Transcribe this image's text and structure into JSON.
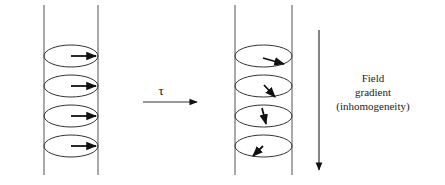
{
  "diagram": {
    "colors": {
      "line": "#444444",
      "arrow": "#111111",
      "background": "#ffffff"
    },
    "left_tube": {
      "x_left": 44,
      "x_right": 98,
      "y_top": 5,
      "y_bottom": 175,
      "spins": [
        {
          "cy": 56,
          "x1": 71,
          "y1": 56,
          "x2": 96,
          "y2": 56
        },
        {
          "cy": 86,
          "x1": 71,
          "y1": 86,
          "x2": 96,
          "y2": 86
        },
        {
          "cy": 116,
          "x1": 71,
          "y1": 116,
          "x2": 96,
          "y2": 116
        },
        {
          "cy": 146,
          "x1": 71,
          "y1": 146,
          "x2": 96,
          "y2": 146
        }
      ]
    },
    "right_tube": {
      "x_left": 235,
      "x_right": 292,
      "y_top": 5,
      "y_bottom": 175,
      "spins": [
        {
          "cy": 56,
          "x1": 263,
          "y1": 58,
          "x2": 284,
          "y2": 64
        },
        {
          "cy": 86,
          "x1": 264,
          "y1": 85,
          "x2": 275,
          "y2": 97
        },
        {
          "cy": 116,
          "x1": 262,
          "y1": 108,
          "x2": 266,
          "y2": 124
        },
        {
          "cy": 146,
          "x1": 263,
          "y1": 146,
          "x2": 253,
          "y2": 156
        }
      ]
    },
    "time_arrow": {
      "label": "τ",
      "x1": 143,
      "x2": 197,
      "y": 102
    },
    "gradient_arrow": {
      "x": 319,
      "y1": 30,
      "y2": 170
    },
    "gradient_label": {
      "lines": [
        "Field",
        "gradient",
        "(inhomogeneity)"
      ]
    }
  }
}
